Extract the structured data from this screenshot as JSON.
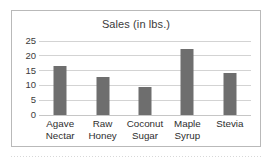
{
  "chart_data": {
    "type": "bar",
    "title": "Sales (in lbs.)",
    "xlabel": "",
    "ylabel": "",
    "ylim": [
      0,
      25
    ],
    "yticks": [
      0,
      5,
      10,
      15,
      20,
      25
    ],
    "grid": true,
    "legend": null,
    "categories": [
      "Agave Nectar",
      "Raw Honey",
      "Coconut Sugar",
      "Maple Syrup",
      "Stevia"
    ],
    "category_lines": [
      [
        "Agave",
        "Nectar"
      ],
      [
        "Raw",
        "Honey"
      ],
      [
        "Coconut",
        "Sugar"
      ],
      [
        "Maple",
        "Syrup"
      ],
      [
        "Stevia",
        ""
      ]
    ],
    "values": [
      16.5,
      13.0,
      9.5,
      22.3,
      14.3
    ],
    "colors": {
      "bar": "#6e6e6e",
      "gridline": "#d3d3d3",
      "baseline": "#c6c6c6",
      "frame": "#b9b9b9",
      "background": "#ffffff",
      "title_text": "#3b3b3b",
      "tick_text": "#3b3b3b",
      "category_text": "#2e2e2e"
    }
  }
}
